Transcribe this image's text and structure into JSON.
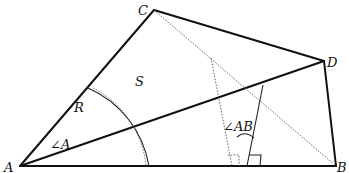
{
  "diagram": {
    "points": {
      "A": "A",
      "B": "B",
      "C": "C",
      "D": "D"
    },
    "labels": {
      "radius": "R",
      "area": "S",
      "angle_a": "∠A",
      "angle_ab": "∠AB"
    },
    "colors": {
      "line": "#111111",
      "dotted": "#555555",
      "background": "#ffffff"
    }
  }
}
